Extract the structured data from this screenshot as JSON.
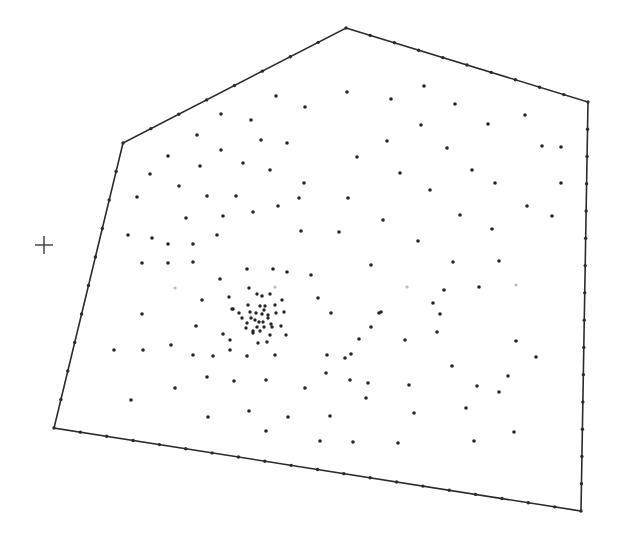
{
  "diagram": {
    "type": "point-distribution-in-polygon",
    "width": 621,
    "height": 553,
    "colors": {
      "background": "#ffffff",
      "boundary": "#2b2b2b",
      "points": "#262626",
      "faint_points": "#bdbdbd",
      "marker": "#3a3a3a"
    },
    "polygon": {
      "vertices": [
        [
          346,
          28
        ],
        [
          588,
          102
        ],
        [
          581,
          511
        ],
        [
          54,
          428
        ],
        [
          123,
          143
        ]
      ],
      "boundary_points_per_edge": [
        10,
        15,
        20,
        10,
        8
      ]
    },
    "marker": {
      "kind": "crosshair",
      "x": 44,
      "y": 245,
      "size": 9
    },
    "interior_points": [
      [
        276,
        96
      ],
      [
        305,
        107
      ],
      [
        347,
        92
      ],
      [
        251,
        120
      ],
      [
        221,
        114
      ],
      [
        197,
        135
      ],
      [
        261,
        140
      ],
      [
        287,
        143
      ],
      [
        168,
        156
      ],
      [
        221,
        150
      ],
      [
        200,
        166
      ],
      [
        243,
        163
      ],
      [
        270,
        170
      ],
      [
        304,
        183
      ],
      [
        150,
        174
      ],
      [
        179,
        186
      ],
      [
        207,
        196
      ],
      [
        236,
        196
      ],
      [
        137,
        197
      ],
      [
        186,
        218
      ],
      [
        223,
        216
      ],
      [
        253,
        212
      ],
      [
        278,
        206
      ],
      [
        299,
        198
      ],
      [
        348,
        198
      ],
      [
        128,
        235
      ],
      [
        152,
        238
      ],
      [
        168,
        244
      ],
      [
        193,
        244
      ],
      [
        217,
        235
      ],
      [
        301,
        231
      ],
      [
        339,
        232
      ],
      [
        168,
        263
      ],
      [
        142,
        263
      ],
      [
        193,
        262
      ],
      [
        247,
        269
      ],
      [
        273,
        269
      ],
      [
        287,
        272
      ],
      [
        311,
        275
      ],
      [
        357,
        157
      ],
      [
        424,
        86
      ],
      [
        391,
        99
      ],
      [
        455,
        104
      ],
      [
        525,
        115
      ],
      [
        421,
        125
      ],
      [
        488,
        124
      ],
      [
        561,
        147
      ],
      [
        387,
        141
      ],
      [
        447,
        148
      ],
      [
        400,
        173
      ],
      [
        472,
        170
      ],
      [
        542,
        146
      ],
      [
        430,
        190
      ],
      [
        495,
        183
      ],
      [
        561,
        183
      ],
      [
        383,
        220
      ],
      [
        460,
        215
      ],
      [
        527,
        206
      ],
      [
        418,
        241
      ],
      [
        492,
        229
      ],
      [
        552,
        216
      ],
      [
        371,
        265
      ],
      [
        453,
        262
      ],
      [
        499,
        261
      ],
      [
        220,
        279
      ],
      [
        262,
        296
      ],
      [
        318,
        298
      ],
      [
        202,
        300
      ],
      [
        233,
        309
      ],
      [
        196,
        326
      ],
      [
        223,
        334
      ],
      [
        230,
        350
      ],
      [
        142,
        314
      ],
      [
        114,
        350
      ],
      [
        143,
        350
      ],
      [
        171,
        345
      ],
      [
        193,
        355
      ],
      [
        213,
        356
      ],
      [
        247,
        356
      ],
      [
        275,
        355
      ],
      [
        131,
        400
      ],
      [
        175,
        388
      ],
      [
        207,
        377
      ],
      [
        234,
        381
      ],
      [
        266,
        380
      ],
      [
        305,
        388
      ],
      [
        326,
        373
      ],
      [
        345,
        358
      ],
      [
        208,
        417
      ],
      [
        249,
        411
      ],
      [
        288,
        417
      ],
      [
        330,
        416
      ],
      [
        366,
        398
      ],
      [
        266,
        431
      ],
      [
        320,
        441
      ],
      [
        379,
        313
      ],
      [
        444,
        290
      ],
      [
        479,
        287
      ],
      [
        331,
        313
      ],
      [
        359,
        339
      ],
      [
        371,
        327
      ],
      [
        405,
        340
      ],
      [
        440,
        314
      ],
      [
        351,
        354
      ],
      [
        368,
        383
      ],
      [
        409,
        385
      ],
      [
        452,
        366
      ],
      [
        477,
        386
      ],
      [
        508,
        376
      ],
      [
        516,
        341
      ],
      [
        536,
        357
      ],
      [
        414,
        413
      ],
      [
        466,
        408
      ],
      [
        499,
        392
      ],
      [
        514,
        432
      ],
      [
        327,
        355
      ],
      [
        350,
        380
      ],
      [
        398,
        443
      ],
      [
        474,
        441
      ],
      [
        433,
        303
      ],
      [
        381,
        312
      ],
      [
        437,
        332
      ],
      [
        353,
        442
      ]
    ],
    "cluster": {
      "center": [
        261,
        318
      ],
      "points": [
        [
          249,
          288
        ],
        [
          257,
          294
        ],
        [
          270,
          294
        ],
        [
          282,
          300
        ],
        [
          229,
          297
        ],
        [
          232,
          309
        ],
        [
          248,
          305
        ],
        [
          260,
          306
        ],
        [
          265,
          306
        ],
        [
          239,
          313
        ],
        [
          250,
          312
        ],
        [
          256,
          313
        ],
        [
          262,
          314
        ],
        [
          264,
          310
        ],
        [
          268,
          315
        ],
        [
          276,
          313
        ],
        [
          284,
          312
        ],
        [
          251,
          318
        ],
        [
          255,
          320
        ],
        [
          259,
          322
        ],
        [
          263,
          322
        ],
        [
          268,
          318
        ],
        [
          271,
          324
        ],
        [
          247,
          323
        ],
        [
          257,
          327
        ],
        [
          264,
          327
        ],
        [
          272,
          327
        ],
        [
          281,
          326
        ],
        [
          246,
          328
        ],
        [
          253,
          331
        ],
        [
          260,
          331
        ],
        [
          270,
          335
        ],
        [
          258,
          343
        ],
        [
          267,
          342
        ],
        [
          230,
          340
        ],
        [
          253,
          333
        ],
        [
          286,
          335
        ],
        [
          242,
          318
        ],
        [
          275,
          305
        ]
      ]
    },
    "faint_points": [
      [
        175,
        288
      ],
      [
        275,
        287
      ],
      [
        407,
        287
      ],
      [
        516,
        285
      ]
    ]
  }
}
